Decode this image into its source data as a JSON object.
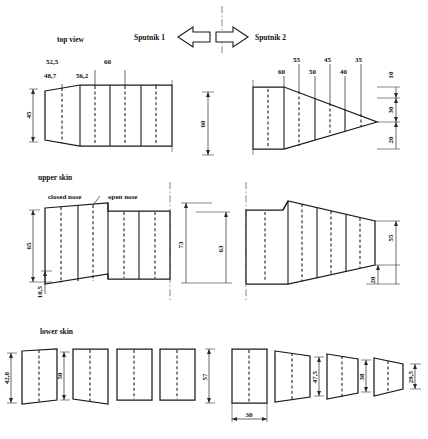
{
  "drawing": {
    "title_labels": {
      "top_view": "top view",
      "upper_skin": "upper skin",
      "lower_skin": "lower skin",
      "sputnik_1": "Sputnik 1",
      "sputnik_2": "Sputnik 2",
      "closed_nose": "closed nose",
      "open_nose": "open nose"
    },
    "top_view": {
      "left_panel_widths": [
        "48,7",
        "52,5",
        "56,2",
        "60"
      ],
      "left_height": "45",
      "center_height": "60",
      "right_panel_widths": [
        "60",
        "55",
        "50",
        "45",
        "40",
        "35"
      ],
      "right_dims": [
        "10",
        "30",
        "20"
      ]
    },
    "upper_skin": {
      "left_height": "65",
      "left_offset": "10,5",
      "center_height_outer": "73",
      "center_height_inner": "63",
      "right_height": "55",
      "right_offset": "20"
    },
    "lower_skin": {
      "left_dims": [
        "42,8",
        "50",
        "57"
      ],
      "right_dims": [
        "47,5",
        "38",
        "29,5"
      ],
      "width_dim": "30"
    },
    "icons": {
      "arrow_left": "arrow-left-icon",
      "arrow_right": "arrow-right-icon",
      "centerline": "centerline-icon"
    },
    "colors": {
      "ink": "#1a1a1a",
      "paper": "#ffffff",
      "dim_gray": "#3a3a3a"
    }
  }
}
